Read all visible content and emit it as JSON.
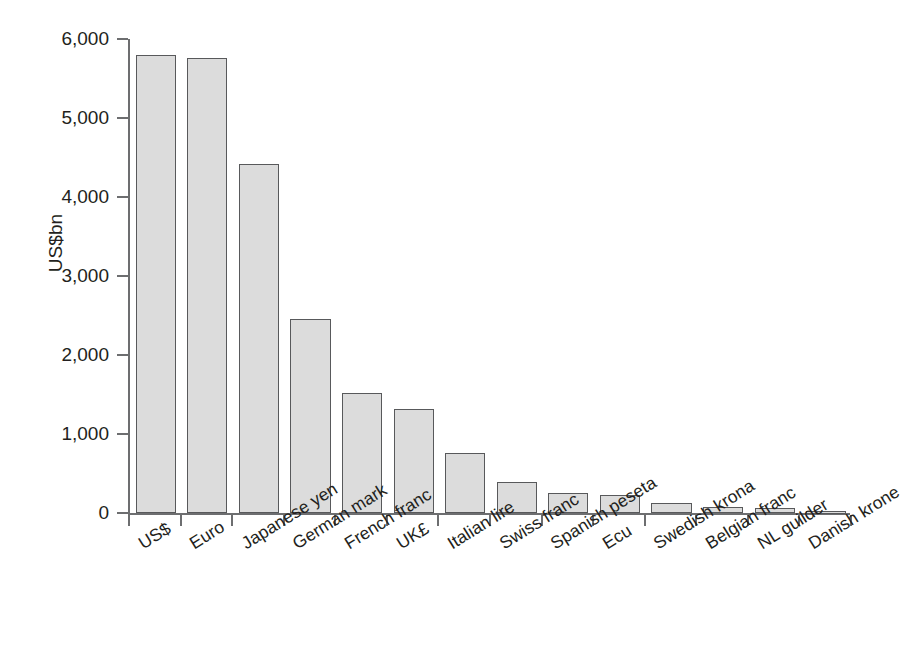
{
  "chart_data": {
    "type": "bar",
    "title": "",
    "xlabel": "",
    "ylabel": "US$bn",
    "ylim": [
      0,
      6000
    ],
    "ytick_labels": [
      "0",
      "1,000",
      "2,000",
      "3,000",
      "4,000",
      "5,000",
      "6,000"
    ],
    "ytick_values": [
      0,
      1000,
      2000,
      3000,
      4000,
      5000,
      6000
    ],
    "grid": false,
    "legend": false,
    "bar_fill_color": "#dcdcdc",
    "bar_edge_color": "#58595b",
    "axis_color": "#6d6e70",
    "categories": [
      "US$",
      "Euro",
      "Japanese yen",
      "German mark",
      "French franc",
      "UK£",
      "Italian lire",
      "Swiss franc",
      "Spanish peseta",
      "Ecu",
      "Swedish krona",
      "Belgian franc",
      "NL guilder",
      "Danish krone"
    ],
    "values": [
      5800,
      5760,
      4420,
      2450,
      1520,
      1320,
      760,
      390,
      250,
      225,
      130,
      80,
      60,
      25
    ]
  }
}
